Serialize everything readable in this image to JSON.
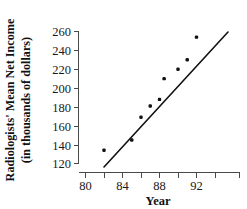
{
  "chart_data": {
    "type": "scatter",
    "title": "",
    "xlabel": "Year",
    "ylabel": "Radiologists' Mean Net Income (in thousands of dollars)",
    "ylabel_line1": "Radiologists' Mean Net Income",
    "ylabel_line2": "(in thousands of dollars)",
    "x": [
      82,
      85,
      86,
      87,
      88,
      88.5,
      90,
      91,
      92
    ],
    "values": [
      134,
      145,
      169,
      181,
      188,
      210,
      220,
      230,
      254
    ],
    "points": [
      {
        "x": 82,
        "y": 134
      },
      {
        "x": 85,
        "y": 145
      },
      {
        "x": 86,
        "y": 169
      },
      {
        "x": 87,
        "y": 181
      },
      {
        "x": 88,
        "y": 188
      },
      {
        "x": 88.5,
        "y": 210
      },
      {
        "x": 90,
        "y": 220
      },
      {
        "x": 91,
        "y": 230
      },
      {
        "x": 92,
        "y": 254
      }
    ],
    "trendline": {
      "label": "least-squares regression line",
      "x_start": 82,
      "y_start": 120,
      "x_end": 93.5,
      "y_end": 261
    },
    "xlim": [
      79,
      94.2
    ],
    "ylim": [
      118,
      263
    ],
    "xticks": [
      80,
      84,
      88,
      92
    ],
    "xticks_labels": [
      "80",
      "84",
      "88",
      "92"
    ],
    "xminorticks": [
      82,
      86,
      90,
      94
    ],
    "yticks": [
      120,
      140,
      160,
      180,
      200,
      220,
      240,
      260
    ],
    "yticks_labels": [
      "120",
      "140",
      "160",
      "180",
      "200",
      "220",
      "240",
      "260"
    ],
    "grid": false,
    "legend": null,
    "marker_color": "#111111",
    "line_color": "#111111",
    "axis_color": "#4a4a4a"
  }
}
